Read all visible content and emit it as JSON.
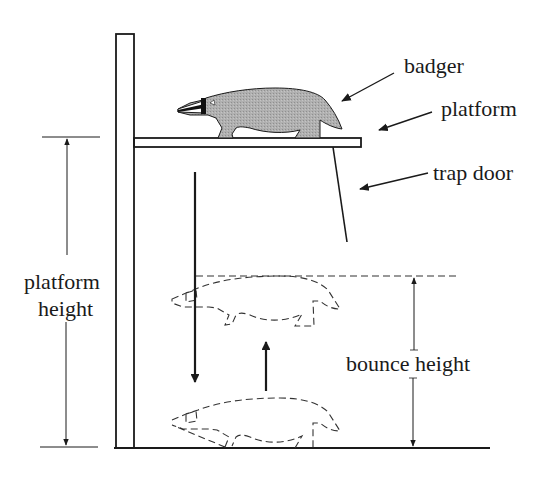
{
  "diagram": {
    "labels": {
      "badger": "badger",
      "platform": "platform",
      "trap_door": "trap door",
      "platform_height_line1": "platform",
      "platform_height_line2": "height",
      "bounce_height": "bounce height"
    },
    "colors": {
      "line": "#1a1a1a",
      "badger_fill": "#a9a9a9",
      "background": "#ffffff"
    },
    "elements": [
      {
        "name": "pole",
        "kind": "vertical-post"
      },
      {
        "name": "platform",
        "kind": "horizontal-board"
      },
      {
        "name": "trap-door",
        "kind": "hinged-panel"
      },
      {
        "name": "badger",
        "kind": "solid-silhouette",
        "state": "on platform"
      },
      {
        "name": "badger-bounce-ghost",
        "kind": "dashed-silhouette",
        "state": "peak of bounce"
      },
      {
        "name": "badger-ground-ghost",
        "kind": "dashed-silhouette",
        "state": "on ground"
      },
      {
        "name": "fall-arrow",
        "kind": "arrow",
        "direction": "down"
      },
      {
        "name": "bounce-arrow",
        "kind": "arrow",
        "direction": "up"
      },
      {
        "name": "platform-height-dimension",
        "kind": "dimension-line"
      },
      {
        "name": "bounce-height-dimension",
        "kind": "dimension-line"
      },
      {
        "name": "ground",
        "kind": "baseline"
      }
    ]
  }
}
